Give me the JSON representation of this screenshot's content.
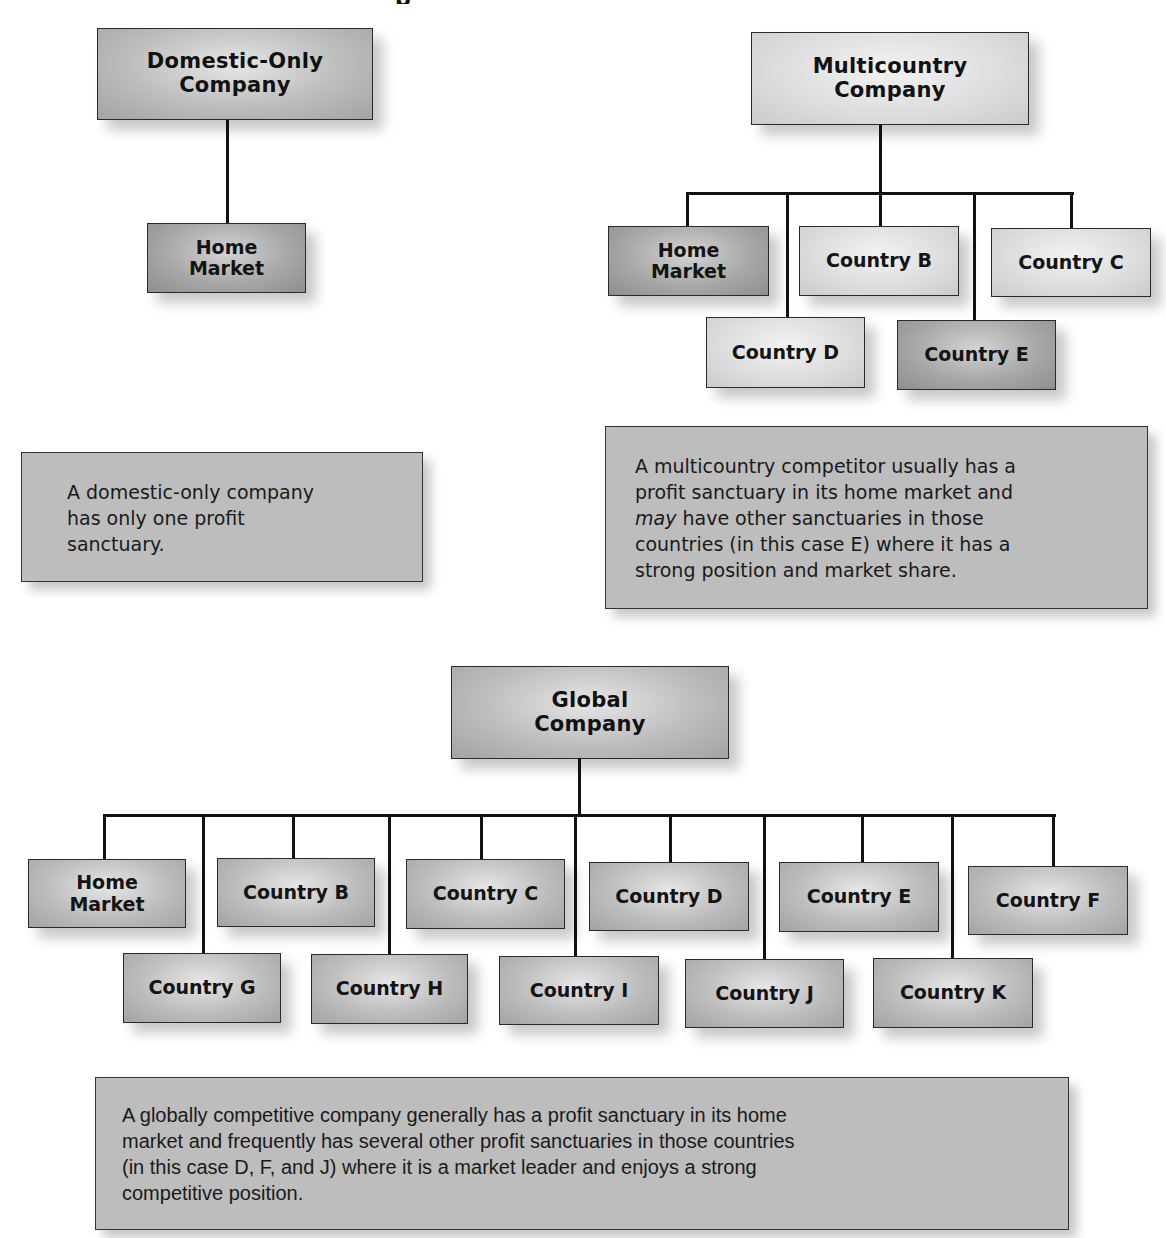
{
  "diagram": {
    "title_fragment": "p",
    "colors": {
      "connector": "#111111",
      "sanctuary_dark": "#9a9a9a",
      "node_mid": "#b5b5b5",
      "node_light": "#d8d8d8",
      "textbox_fill": "#bdbdbd"
    },
    "domestic": {
      "header": {
        "line1": "Domestic-Only",
        "line2": "Company"
      },
      "nodes": [
        {
          "line1": "Home",
          "line2": "Market",
          "sanctuary": true
        }
      ],
      "description": {
        "lines": [
          "A domestic-only company",
          "has only one profit",
          "sanctuary."
        ]
      }
    },
    "multicountry": {
      "header": {
        "line1": "Multicountry",
        "line2": "Company"
      },
      "nodes": [
        {
          "line1": "Home",
          "line2": "Market",
          "sanctuary": true
        },
        {
          "label": "Country B",
          "sanctuary": false
        },
        {
          "label": "Country C",
          "sanctuary": false
        },
        {
          "label": "Country D",
          "sanctuary": false
        },
        {
          "label": "Country E",
          "sanctuary": true
        }
      ],
      "description": {
        "line1": "A multicountry competitor usually has a",
        "line2": "profit sanctuary in its home market and",
        "line3_italic": "may",
        "line3_rest": " have other sanctuaries in those",
        "line4": "countries (in this case E) where it has a",
        "line5": "strong position and market share."
      }
    },
    "global": {
      "header": {
        "line1": "Global",
        "line2": "Company"
      },
      "top_row": [
        {
          "line1": "Home",
          "line2": "Market"
        },
        {
          "label": "Country B"
        },
        {
          "label": "Country C"
        },
        {
          "label": "Country D"
        },
        {
          "label": "Country E"
        },
        {
          "label": "Country F"
        }
      ],
      "bottom_row": [
        {
          "label": "Country G"
        },
        {
          "label": "Country H"
        },
        {
          "label": "Country I"
        },
        {
          "label": "Country J"
        },
        {
          "label": "Country K"
        }
      ],
      "description": {
        "lines": [
          "A globally competitive company generally has a profit sanctuary in its home",
          "market and frequently has several other profit sanctuaries in those countries",
          "(in this case D, F, and J) where it is a market leader and enjoys a strong",
          "competitive position."
        ]
      }
    }
  }
}
